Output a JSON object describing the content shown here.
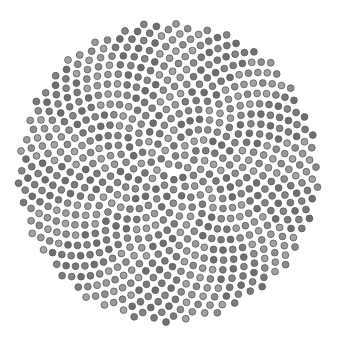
{
  "figure": {
    "type": "phyllotaxis-spiral",
    "width": 338,
    "height": 346,
    "center": [
      168,
      172
    ],
    "dot_count": 720,
    "spacing": 5.6,
    "dot_radius": 3.4,
    "golden_angle_deg": 137.508,
    "colors": {
      "background": "#ffffff",
      "dot_fills": [
        "#8c8c8c",
        "#7a7a7a",
        "#9a9a9a",
        "#6e6e6e",
        "#a3a3a3",
        "#858585"
      ],
      "dot_stroke": "#5a5a5a"
    }
  }
}
